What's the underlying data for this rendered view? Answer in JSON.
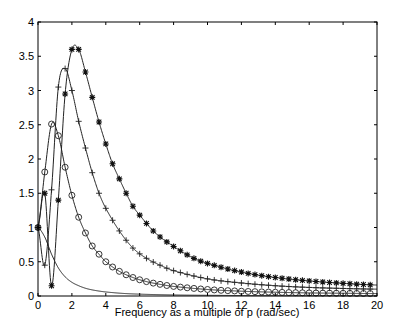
{
  "chart_data": {
    "type": "line",
    "title": "",
    "xlabel": "Frequency as a multiple of p (rad/sec)",
    "ylabel": "",
    "xlim": [
      0,
      20
    ],
    "ylim": [
      0,
      4
    ],
    "xticks": [
      0,
      2,
      4,
      6,
      8,
      10,
      12,
      14,
      16,
      18,
      20
    ],
    "yticks": [
      0,
      0.5,
      1,
      1.5,
      2,
      2.5,
      3,
      3.5,
      4
    ],
    "ytick_labels": [
      "0",
      "0.5",
      "1",
      "1.5",
      "2",
      "2.5",
      "3",
      "3.5",
      "4"
    ],
    "grid": false,
    "legend": null,
    "marker_spacing": 0.4,
    "series": [
      {
        "name": "plain",
        "marker": "none",
        "x": [
          0,
          0.4,
          0.8,
          1.2,
          1.6,
          2.0,
          2.4,
          2.8,
          3.2,
          3.6,
          4.0,
          5.0,
          6.0,
          8.0,
          10.0,
          14.0,
          20.0
        ],
        "y": [
          1.0,
          0.86,
          0.61,
          0.41,
          0.28,
          0.2,
          0.15,
          0.113,
          0.089,
          0.072,
          0.059,
          0.038,
          0.027,
          0.015,
          0.01,
          0.005,
          0.0025
        ]
      },
      {
        "name": "circles",
        "marker": "o",
        "x": [
          0,
          0.4,
          0.8,
          1.2,
          1.6,
          2.0,
          2.4,
          2.8,
          3.2,
          3.6,
          4.0,
          4.8,
          5.6,
          6.4,
          7.2,
          8.0,
          10.0,
          12.0,
          14.0,
          16.0,
          18.0,
          20.0
        ],
        "y": [
          1.0,
          1.81,
          2.51,
          2.34,
          1.88,
          1.47,
          1.15,
          0.92,
          0.73,
          0.61,
          0.5,
          0.36,
          0.27,
          0.21,
          0.17,
          0.14,
          0.095,
          0.07,
          0.055,
          0.045,
          0.04,
          0.035
        ]
      },
      {
        "name": "plus",
        "marker": "+",
        "x": [
          0,
          0.4,
          0.8,
          1.2,
          1.6,
          2.0,
          2.4,
          2.8,
          3.2,
          3.6,
          4.0,
          4.8,
          5.6,
          6.4,
          7.2,
          8.0,
          10.0,
          12.0,
          14.0,
          16.0,
          18.0,
          20.0
        ],
        "y": [
          1.0,
          0.45,
          1.55,
          3.05,
          3.32,
          3.0,
          2.55,
          2.16,
          1.8,
          1.5,
          1.28,
          0.95,
          0.7,
          0.55,
          0.45,
          0.37,
          0.25,
          0.19,
          0.15,
          0.125,
          0.11,
          0.1
        ]
      },
      {
        "name": "asterisks",
        "marker": "*",
        "x": [
          0,
          0.4,
          0.8,
          1.2,
          1.6,
          2.0,
          2.4,
          2.8,
          3.2,
          3.6,
          4.0,
          4.4,
          4.8,
          5.2,
          5.6,
          6.0,
          6.8,
          7.6,
          9.2,
          10.8,
          12.4,
          14.0,
          16.0,
          18.0,
          20.0
        ],
        "y": [
          1.0,
          1.5,
          0.15,
          1.4,
          2.95,
          3.6,
          3.6,
          3.27,
          2.9,
          2.54,
          2.22,
          1.93,
          1.71,
          1.5,
          1.31,
          1.18,
          0.95,
          0.79,
          0.55,
          0.42,
          0.33,
          0.27,
          0.22,
          0.185,
          0.16
        ]
      }
    ]
  }
}
